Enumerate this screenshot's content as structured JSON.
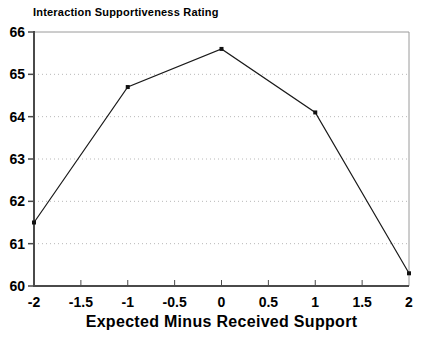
{
  "title": "Interaction Supportiveness Rating",
  "chart_data": {
    "type": "line",
    "title": "Interaction Supportiveness Rating",
    "xlabel": "Expected Minus Received Support",
    "ylabel": "",
    "x": [
      -2,
      -1,
      0,
      1,
      2
    ],
    "values": [
      61.5,
      64.7,
      65.6,
      64.1,
      60.3
    ],
    "xlim": [
      -2,
      2
    ],
    "ylim": [
      60,
      66
    ],
    "x_ticks": [
      -2,
      -1.5,
      -1,
      -0.5,
      0,
      0.5,
      1,
      1.5,
      2
    ],
    "x_tick_labels": [
      "-2",
      "-1.5",
      "-1",
      "-0.5",
      "0",
      "0.5",
      "1",
      "1.5",
      "2"
    ],
    "y_ticks": [
      60,
      61,
      62,
      63,
      64,
      65,
      66
    ],
    "y_tick_labels": [
      "60",
      "61",
      "62",
      "63",
      "64",
      "65",
      "66"
    ],
    "gridlines_at": [
      61,
      62,
      63,
      64,
      65
    ],
    "grid_style": "dotted-horizontal",
    "legend": "none",
    "marker": "filled-square",
    "colors": {
      "line": "#1a1a1a",
      "marker": "#111111",
      "grid": "#b8b8b8",
      "axis": "#4a4a4a",
      "frame": "#9a9a9a",
      "background": "#ffffff",
      "text": "#000000"
    }
  }
}
